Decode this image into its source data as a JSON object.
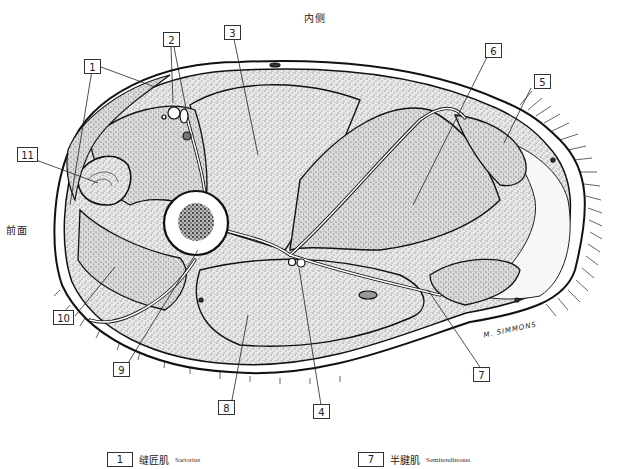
{
  "figure": {
    "orientation": {
      "top": "内侧",
      "left": "前面"
    },
    "signature": "M. SIMMONS",
    "callouts": [
      {
        "id": "1",
        "label": "1"
      },
      {
        "id": "2",
        "label": "2"
      },
      {
        "id": "3",
        "label": "3"
      },
      {
        "id": "4",
        "label": "4"
      },
      {
        "id": "5",
        "label": "5"
      },
      {
        "id": "6",
        "label": "6"
      },
      {
        "id": "7",
        "label": "7"
      },
      {
        "id": "8",
        "label": "8"
      },
      {
        "id": "9",
        "label": "9"
      },
      {
        "id": "10",
        "label": "10"
      },
      {
        "id": "11",
        "label": "11"
      }
    ],
    "colors": {
      "ink": "#1a1a1a",
      "stipple": "#555555",
      "background": "#ffffff"
    }
  },
  "legend": [
    {
      "num": "1",
      "cn": "缝匠肌",
      "en": "Sartorius"
    },
    {
      "num": "7",
      "cn": "半腱肌",
      "en": "Semitendinosus"
    }
  ]
}
